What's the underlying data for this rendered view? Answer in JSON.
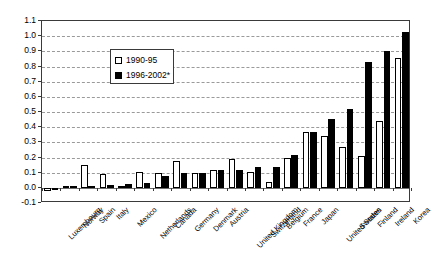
{
  "chart_data": {
    "type": "bar",
    "title": "",
    "subtitle": "",
    "xlabel": "",
    "ylabel": "",
    "ylim": [
      -0.1,
      1.1
    ],
    "ytick_step": 0.1,
    "yticks": [
      "1.1",
      "1.0",
      "0.9",
      "0.8",
      "0.7",
      "0.6",
      "0.5",
      "0.4",
      "0.3",
      "0.2",
      "0.1",
      "0.0",
      "-0.1"
    ],
    "grid": true,
    "grid_style": "horizontal-dashed",
    "legend_position": "top-left-inside",
    "categories": [
      "Luxembourg",
      "Norway",
      "Spain",
      "Italy",
      "Mexico",
      "Netherlands",
      "Canada",
      "Germany",
      "Denmark",
      "Austria",
      "United Kingdom",
      "Switzerland",
      "Belgium",
      "France",
      "Japan",
      "United States",
      "Sweden",
      "Finland",
      "Ireland",
      "Korea"
    ],
    "series": [
      {
        "name": "1990-95",
        "color": "#ffffff",
        "values": [
          -0.02,
          0.01,
          0.15,
          0.09,
          0.01,
          0.105,
          0.1,
          0.175,
          0.095,
          0.115,
          0.19,
          0.105,
          0.04,
          0.2,
          0.365,
          0.345,
          0.27,
          0.21,
          0.44,
          0.855
        ]
      },
      {
        "name": "1996-2002*",
        "color": "#000000",
        "values": [
          -0.015,
          0.01,
          0.015,
          0.02,
          0.025,
          0.03,
          0.075,
          0.1,
          0.1,
          0.115,
          0.12,
          0.135,
          0.135,
          0.215,
          0.365,
          0.455,
          0.52,
          0.83,
          0.9,
          1.03
        ]
      }
    ]
  },
  "legend": {
    "items": [
      {
        "label": "1990-95",
        "swatch": "open-square-white"
      },
      {
        "label": "1996-2002*",
        "swatch": "filled-square-black"
      }
    ]
  }
}
